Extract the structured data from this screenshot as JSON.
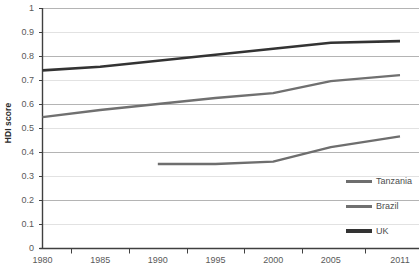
{
  "chart_data": {
    "type": "line",
    "title": "",
    "subtitle": "",
    "xlabel": "",
    "ylabel": "HDI score",
    "grid": true,
    "legend_position": "bottom-right",
    "x": [
      1980,
      1985,
      1990,
      1995,
      2000,
      2005,
      2011
    ],
    "xlim": [
      1980,
      2011
    ],
    "ylim": [
      0,
      1
    ],
    "yticks": [
      "1",
      "0.9",
      "0.8",
      "0.7",
      "0.6",
      "0.5",
      "0.4",
      "0.3",
      "0.2",
      "0.1",
      "0"
    ],
    "ytick_values": [
      1,
      0.9,
      0.8,
      0.7,
      0.6,
      0.5,
      0.4,
      0.3,
      0.2,
      0.1,
      0
    ],
    "xticks": [
      "1980",
      "1985",
      "1990",
      "1995",
      "2000",
      "2005",
      "2011"
    ],
    "series": [
      {
        "name": "Tanzania",
        "color": "#6e6e6e",
        "x": [
          1990,
          1995,
          2000,
          2005,
          2011
        ],
        "values": [
          0.35,
          0.35,
          0.36,
          0.42,
          0.465
        ]
      },
      {
        "name": "Brazil",
        "color": "#707070",
        "x": [
          1980,
          1985,
          1990,
          1995,
          2000,
          2005,
          2011
        ],
        "values": [
          0.545,
          0.575,
          0.6,
          0.625,
          0.645,
          0.695,
          0.72
        ]
      },
      {
        "name": "UK",
        "color": "#333333",
        "x": [
          1980,
          1985,
          1990,
          1995,
          2000,
          2005,
          2011
        ],
        "values": [
          0.74,
          0.755,
          0.78,
          0.805,
          0.83,
          0.855,
          0.862
        ]
      }
    ]
  },
  "legend": {
    "items": [
      {
        "label": "Tanzania",
        "color": "#6e6e6e"
      },
      {
        "label": "Brazil",
        "color": "#707070"
      },
      {
        "label": "UK",
        "color": "#333333"
      }
    ]
  },
  "axes": {
    "y_title": "HDI score"
  },
  "style": {
    "grid_color_major": "#b4b4b4",
    "grid_color_minor": "#e2e2e2",
    "axis_color": "#404040",
    "background": "#ffffff"
  }
}
